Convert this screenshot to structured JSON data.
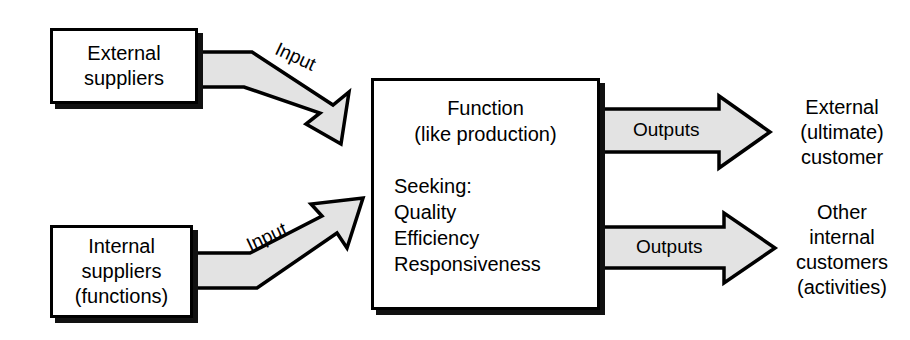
{
  "diagram": {
    "colors": {
      "arrow_fill": "#e3e3e3",
      "stroke": "#000000",
      "box_fill": "#ffffff",
      "shadow": "#111111",
      "background": "#ffffff"
    },
    "sources": [
      {
        "id": "external-suppliers",
        "label": "External\nsuppliers"
      },
      {
        "id": "internal-suppliers",
        "label": "Internal\nsuppliers\n(functions)"
      }
    ],
    "process": {
      "id": "function-box",
      "heading": "Function\n(like production)",
      "seeking_label": "Seeking:",
      "seeking_items": [
        "Quality",
        "Efficiency",
        "Responsiveness"
      ]
    },
    "input_arrows": [
      {
        "id": "input-arrow-top",
        "label": "Input"
      },
      {
        "id": "input-arrow-bottom",
        "label": "Input"
      }
    ],
    "output_arrows": [
      {
        "id": "output-arrow-top",
        "label": "Outputs"
      },
      {
        "id": "output-arrow-bottom",
        "label": "Outputs"
      }
    ],
    "destinations": [
      {
        "id": "external-customer",
        "label": "External\n(ultimate)\ncustomer"
      },
      {
        "id": "other-internal-customers",
        "label": "Other\ninternal\ncustomers\n(activities)"
      }
    ]
  }
}
